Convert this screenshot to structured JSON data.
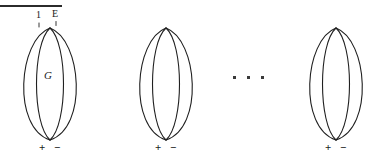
{
  "figure": {
    "background_color": "#ffffff",
    "stroke_color": "#1f1f1f",
    "text_color": "#1a1a1a",
    "width": 384,
    "height": 159,
    "top_rule": {
      "present": true,
      "x": 0,
      "y": 5,
      "width": 62,
      "height": 2,
      "color": "#2b2b2b"
    },
    "ellipsis": {
      "text": "...",
      "dot_count": 3,
      "x": 243,
      "y": 77
    },
    "shapes": [
      {
        "id": "shape-1",
        "name": "bigon-graph-labeled",
        "x": 6,
        "center_x": 50,
        "top_vertex_y": 28,
        "bottom_vertex_y": 140,
        "left_arc_half_width": 29,
        "right_arc_half_width": 29,
        "arc_offset": 16,
        "labels": {
          "top_left": "1",
          "top_right": "E",
          "interior": "G",
          "bottom_left": "+",
          "bottom_right": "−"
        },
        "tick_marks": 2
      },
      {
        "id": "shape-2",
        "name": "bigon-graph-plain",
        "x": 122,
        "center_x": 165,
        "top_vertex_y": 28,
        "bottom_vertex_y": 140,
        "left_arc_half_width": 29,
        "right_arc_half_width": 29,
        "arc_offset": 16,
        "labels": {
          "top_left": "",
          "top_right": "",
          "interior": "",
          "bottom_left": "+",
          "bottom_right": "−"
        },
        "tick_marks": 0
      },
      {
        "id": "shape-3",
        "name": "bigon-graph-last",
        "x": 292,
        "center_x": 335,
        "top_vertex_y": 28,
        "bottom_vertex_y": 140,
        "left_arc_half_width": 29,
        "right_arc_half_width": 29,
        "arc_offset": 16,
        "labels": {
          "top_left": "",
          "top_right": "",
          "interior": "",
          "bottom_left": "+",
          "bottom_right": "−"
        },
        "tick_marks": 0
      }
    ]
  }
}
